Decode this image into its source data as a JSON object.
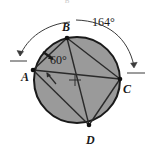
{
  "figure": {
    "type": "circle-geometry-diagram",
    "background_color": "#ffffff",
    "circle": {
      "fill_color": "#9a9a9a",
      "stroke_color": "#1a1a1a",
      "center_x": 77,
      "center_y": 80,
      "radius": 43,
      "center_mark": "plus-cross"
    },
    "points": [
      {
        "id": "A",
        "label": "A",
        "x": 33,
        "y": 70,
        "label_x": 21,
        "label_y": 81
      },
      {
        "id": "B",
        "label": "B",
        "x": 67,
        "y": 38,
        "label_x": 62,
        "label_y": 31
      },
      {
        "id": "C",
        "label": "C",
        "x": 120,
        "y": 79,
        "label_x": 123,
        "label_y": 93
      },
      {
        "id": "D",
        "label": "D",
        "x": 89,
        "y": 125,
        "label_x": 86,
        "label_y": 144
      }
    ],
    "chords": [
      {
        "from": "A",
        "to": "B"
      },
      {
        "from": "A",
        "to": "C"
      },
      {
        "from": "A",
        "to": "D"
      },
      {
        "from": "B",
        "to": "C"
      },
      {
        "from": "B",
        "to": "D"
      },
      {
        "from": "D",
        "to": "C"
      }
    ],
    "angle_labels": [
      {
        "id": "inscribed-angle",
        "text": "60°",
        "x": 50,
        "y": 64
      },
      {
        "id": "arc-angle",
        "text": "164°",
        "x": 92,
        "y": 26
      }
    ],
    "arc_measures": [
      {
        "id": "arc-AB-marker",
        "value": "60°",
        "endpoints": [
          "A",
          "B"
        ]
      },
      {
        "id": "arc-BC-marker",
        "value": "164°",
        "endpoints": [
          "B",
          "C"
        ]
      }
    ],
    "markers": {
      "arc_AB_hash": "tick-hash-on-chord-AB",
      "interior_arrow": "arrow-pointing-to-arc-AB",
      "left_outer_arc": "arc-with-arrowhead-at-A",
      "right_outer_arc": "arc-with-arrowhead-at-C"
    },
    "top_fragment": "B"
  }
}
